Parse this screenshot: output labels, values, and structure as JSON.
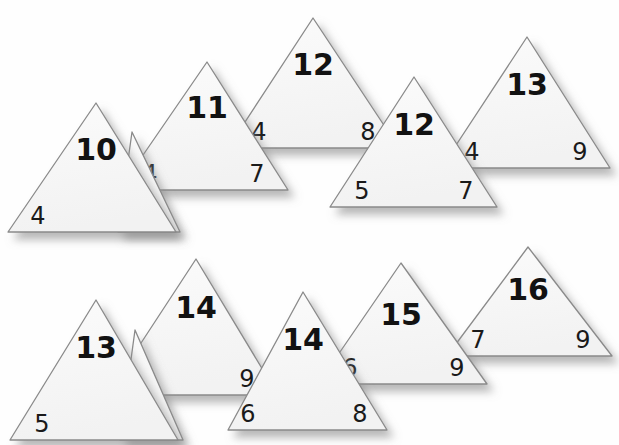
{
  "scene": {
    "title": "Overlapping numbered triangles worksheet",
    "background_color": "#fefefe",
    "triangle_fill": "#f7f7f7",
    "triangle_stroke": "#8a8a8a",
    "shadow_color": "#9a9a9a",
    "label_color": "#121212"
  },
  "triangles": [
    {
      "id": "t-top-1",
      "main_label": "10",
      "bottom_left_label": "4",
      "bottom_right_label": "",
      "apex": {
        "x": 96,
        "y": 103
      },
      "base_left": {
        "x": 8,
        "y": 232
      },
      "base_right": {
        "x": 176,
        "y": 232
      },
      "main_label_pos": {
        "x": 96,
        "y": 160
      },
      "bl_label_pos": {
        "x": 38,
        "y": 224
      },
      "br_label_pos": {
        "x": 150,
        "y": 224
      }
    },
    {
      "id": "t-top-small-6",
      "main_label": "",
      "bottom_left_label": "6",
      "bottom_right_label": "",
      "apex": {
        "x": 132,
        "y": 132
      },
      "base_left": {
        "x": 118,
        "y": 232
      },
      "base_right": {
        "x": 180,
        "y": 232
      },
      "main_label_pos": {
        "x": 132,
        "y": 170
      },
      "bl_label_pos": {
        "x": 148,
        "y": 224
      },
      "br_label_pos": {
        "x": 170,
        "y": 224
      }
    },
    {
      "id": "t-top-2",
      "main_label": "11",
      "bottom_left_label": "4",
      "bottom_right_label": "7",
      "apex": {
        "x": 207,
        "y": 62
      },
      "base_left": {
        "x": 119,
        "y": 190
      },
      "base_right": {
        "x": 288,
        "y": 190
      },
      "main_label_pos": {
        "x": 207,
        "y": 118
      },
      "bl_label_pos": {
        "x": 150,
        "y": 182
      },
      "br_label_pos": {
        "x": 257,
        "y": 182
      }
    },
    {
      "id": "t-top-3",
      "main_label": "12",
      "bottom_left_label": "4",
      "bottom_right_label": "8",
      "apex": {
        "x": 313,
        "y": 18
      },
      "base_left": {
        "x": 228,
        "y": 148
      },
      "base_right": {
        "x": 399,
        "y": 148
      },
      "main_label_pos": {
        "x": 313,
        "y": 75
      },
      "bl_label_pos": {
        "x": 259,
        "y": 140
      },
      "br_label_pos": {
        "x": 368,
        "y": 140
      }
    },
    {
      "id": "t-top-4",
      "main_label": "12",
      "bottom_left_label": "5",
      "bottom_right_label": "7",
      "apex": {
        "x": 414,
        "y": 77
      },
      "base_left": {
        "x": 330,
        "y": 207
      },
      "base_right": {
        "x": 497,
        "y": 207
      },
      "main_label_pos": {
        "x": 414,
        "y": 135
      },
      "bl_label_pos": {
        "x": 362,
        "y": 199
      },
      "br_label_pos": {
        "x": 466,
        "y": 199
      }
    },
    {
      "id": "t-top-5",
      "main_label": "13",
      "bottom_left_label": "4",
      "bottom_right_label": "9",
      "apex": {
        "x": 527,
        "y": 37
      },
      "base_left": {
        "x": 441,
        "y": 168
      },
      "base_right": {
        "x": 610,
        "y": 168
      },
      "main_label_pos": {
        "x": 527,
        "y": 95
      },
      "bl_label_pos": {
        "x": 472,
        "y": 160
      },
      "br_label_pos": {
        "x": 580,
        "y": 160
      }
    },
    {
      "id": "t-bot-1",
      "main_label": "13",
      "bottom_left_label": "5",
      "bottom_right_label": "",
      "apex": {
        "x": 96,
        "y": 300
      },
      "base_left": {
        "x": 10,
        "y": 440
      },
      "base_right": {
        "x": 178,
        "y": 440
      },
      "main_label_pos": {
        "x": 96,
        "y": 358
      },
      "bl_label_pos": {
        "x": 42,
        "y": 432
      },
      "br_label_pos": {
        "x": 150,
        "y": 432
      }
    },
    {
      "id": "t-bot-small-8",
      "main_label": "",
      "bottom_left_label": "8",
      "bottom_right_label": "",
      "apex": {
        "x": 135,
        "y": 330
      },
      "base_left": {
        "x": 120,
        "y": 440
      },
      "base_right": {
        "x": 183,
        "y": 440
      },
      "main_label_pos": {
        "x": 135,
        "y": 380
      },
      "bl_label_pos": {
        "x": 151,
        "y": 432
      },
      "br_label_pos": {
        "x": 173,
        "y": 432
      }
    },
    {
      "id": "t-bot-2",
      "main_label": "14",
      "bottom_left_label": "5",
      "bottom_right_label": "9",
      "apex": {
        "x": 196,
        "y": 259
      },
      "base_left": {
        "x": 107,
        "y": 395
      },
      "base_right": {
        "x": 278,
        "y": 395
      },
      "main_label_pos": {
        "x": 196,
        "y": 318
      },
      "bl_label_pos": {
        "x": 139,
        "y": 387
      },
      "br_label_pos": {
        "x": 247,
        "y": 387
      }
    },
    {
      "id": "t-bot-3",
      "main_label": "14",
      "bottom_left_label": "6",
      "bottom_right_label": "8",
      "apex": {
        "x": 303,
        "y": 292
      },
      "base_left": {
        "x": 228,
        "y": 430
      },
      "base_right": {
        "x": 387,
        "y": 430
      },
      "main_label_pos": {
        "x": 303,
        "y": 350
      },
      "bl_label_pos": {
        "x": 248,
        "y": 422
      },
      "br_label_pos": {
        "x": 360,
        "y": 422
      }
    },
    {
      "id": "t-bot-4",
      "main_label": "15",
      "bottom_left_label": "6",
      "bottom_right_label": "9",
      "apex": {
        "x": 401,
        "y": 263
      },
      "base_left": {
        "x": 318,
        "y": 384
      },
      "base_right": {
        "x": 487,
        "y": 384
      },
      "main_label_pos": {
        "x": 401,
        "y": 325
      },
      "bl_label_pos": {
        "x": 350,
        "y": 376
      },
      "br_label_pos": {
        "x": 457,
        "y": 376
      }
    },
    {
      "id": "t-bot-5",
      "main_label": "16",
      "bottom_left_label": "7",
      "bottom_right_label": "9",
      "apex": {
        "x": 528,
        "y": 247
      },
      "base_left": {
        "x": 447,
        "y": 356
      },
      "base_right": {
        "x": 612,
        "y": 356
      },
      "main_label_pos": {
        "x": 528,
        "y": 300
      },
      "bl_label_pos": {
        "x": 478,
        "y": 348
      },
      "br_label_pos": {
        "x": 583,
        "y": 348
      }
    }
  ],
  "draw_order": [
    "t-top-5",
    "t-top-3",
    "t-top-4",
    "t-top-2",
    "t-top-small-6",
    "t-top-1",
    "t-bot-5",
    "t-bot-4",
    "t-bot-2",
    "t-bot-3",
    "t-bot-small-8",
    "t-bot-1"
  ]
}
